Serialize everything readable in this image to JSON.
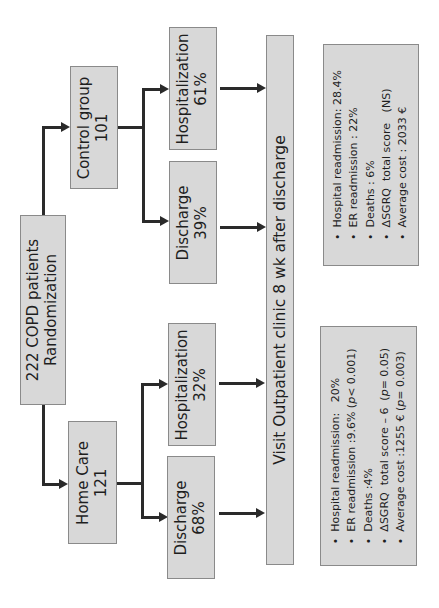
{
  "root": {
    "line1": "222 COPD patients",
    "line2": "Randomization"
  },
  "groups": {
    "control": {
      "label": "Control group",
      "count": "101"
    },
    "home_care": {
      "label": "Home Care",
      "count": "121"
    }
  },
  "outcomes": {
    "control_hospitalization": {
      "label": "Hospitalization",
      "value": "61%"
    },
    "control_discharge": {
      "label": "Discharge",
      "value": "39%"
    },
    "home_hospitalization": {
      "label": "Hospitalization",
      "value": "32%"
    },
    "home_discharge": {
      "label": "Discharge",
      "value": "68%"
    }
  },
  "followup": {
    "label": "Visit Outpatient clinic 8 wk after discharge"
  },
  "results": {
    "control": [
      "Hospital readmission: 28.4%",
      "ER readmission : 22%",
      "Deaths : 6%",
      "ΔSGRQ  total score   (NS)",
      "Average cost : 2033 €"
    ],
    "home_care": [
      {
        "text": "Hospital readmission:   20%",
        "p": ""
      },
      {
        "text": "ER readmission :9.6% (",
        "p": "p",
        "after": "< 0.001)"
      },
      {
        "text": "Deaths :4%",
        "p": ""
      },
      {
        "text": "ΔSGRQ  total score – 6  (",
        "p": "p",
        "after": "= 0.05)"
      },
      {
        "text": "Average cost :1255 € (",
        "p": "p",
        "after": "= 0.003)"
      }
    ]
  },
  "colors": {
    "box_fill": "#d8d8d8",
    "box_border": "#8a8a8a",
    "connector": "#2a2a2a"
  }
}
